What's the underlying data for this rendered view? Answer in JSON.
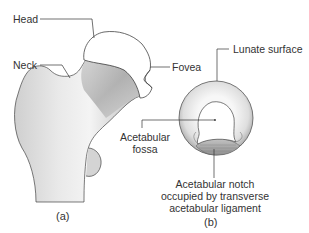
{
  "figure": {
    "panels": [
      {
        "id": "a",
        "caption": "(a)",
        "subject": "proximal femur",
        "labels": {
          "head": "Head",
          "neck": "Neck",
          "fovea": "Fovea"
        }
      },
      {
        "id": "b",
        "caption": "(b)",
        "subject": "acetabulum",
        "labels": {
          "lunate_surface": "Lunate surface",
          "acetabular_fossa_line1": "Acetabular",
          "acetabular_fossa_line2": "fossa",
          "notch_line1": "Acetabular notch",
          "notch_line2": "occupied by transverse",
          "notch_line3": "acetabular ligament"
        }
      }
    ],
    "colors": {
      "bone_light": "#efefef",
      "bone_shadow": "#a9a9a9",
      "cartilage": "#ffffff",
      "outline": "#444444",
      "leader_line": "#333333",
      "text": "#333333"
    }
  }
}
